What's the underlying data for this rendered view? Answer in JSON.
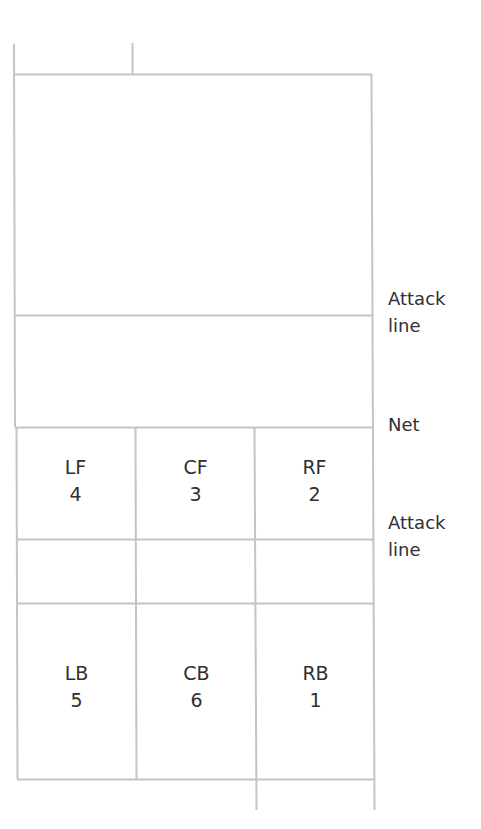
{
  "diagram": {
    "line_color": "#c4c4c4",
    "text_color": "#303030",
    "side_labels": {
      "upper_attack_line": [
        "Attack",
        "line"
      ],
      "net": "Net",
      "lower_attack_line": [
        "Attack",
        "line"
      ]
    },
    "front_row": [
      {
        "code": "LF",
        "number": "4"
      },
      {
        "code": "CF",
        "number": "3"
      },
      {
        "code": "RF",
        "number": "2"
      }
    ],
    "back_row": [
      {
        "code": "LB",
        "number": "5"
      },
      {
        "code": "CB",
        "number": "6"
      },
      {
        "code": "RB",
        "number": "1"
      }
    ]
  }
}
